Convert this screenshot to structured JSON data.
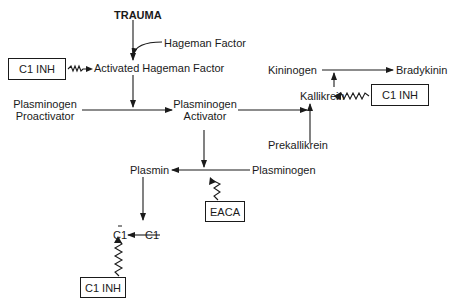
{
  "diagram": {
    "nodes": {
      "trauma": "TRAUMA",
      "hageman_factor": "Hageman Factor",
      "activated_hageman_factor": "Activated Hageman Factor",
      "plasminogen_proactivator_line1": "Plasminogen",
      "plasminogen_proactivator_line2": "Proactivator",
      "plasminogen_activator_line1": "Plasminogen",
      "plasminogen_activator_line2": "Activator",
      "kininogen": "Kininogen",
      "bradykinin": "Bradykinin",
      "kallikrein": "Kallikrein",
      "prekallikrein": "Prekallikrein",
      "plasmin": "Plasmin",
      "plasminogen": "Plasminogen",
      "c1_activated": "C1",
      "c1": "C1"
    },
    "inhibitors": {
      "c1_inh_top": "C1 INH",
      "c1_inh_right": "C1 INH",
      "c1_inh_bottom": "C1 INH",
      "eaca": "EACA"
    },
    "edges": [
      {
        "from": "TRAUMA",
        "to": "Activated Hageman Factor",
        "type": "activation"
      },
      {
        "from": "Hageman Factor",
        "to": "Activated Hageman Factor",
        "type": "activation"
      },
      {
        "from": "Activated Hageman Factor",
        "to": "Plasminogen Activator",
        "type": "activation"
      },
      {
        "from": "Plasminogen Proactivator",
        "to": "Plasminogen Activator",
        "type": "activation"
      },
      {
        "from": "Plasminogen Activator",
        "to": "Kallikrein",
        "type": "activation"
      },
      {
        "from": "Prekallikrein",
        "to": "Kallikrein",
        "type": "activation"
      },
      {
        "from": "Kallikrein",
        "to": "Kininogen→Bradykinin",
        "type": "activation"
      },
      {
        "from": "Kininogen",
        "to": "Bradykinin",
        "type": "activation"
      },
      {
        "from": "Plasminogen Activator",
        "to": "Plasminogen→Plasmin",
        "type": "activation"
      },
      {
        "from": "Plasminogen",
        "to": "Plasmin",
        "type": "activation"
      },
      {
        "from": "Plasmin",
        "to": "C1 (activated)",
        "type": "activation"
      },
      {
        "from": "C1",
        "to": "C1 (activated)",
        "type": "activation"
      },
      {
        "from": "C1 INH",
        "to": "Activated Hageman Factor",
        "type": "inhibition"
      },
      {
        "from": "C1 INH",
        "to": "Kallikrein",
        "type": "inhibition"
      },
      {
        "from": "EACA",
        "to": "Plasminogen→Plasmin",
        "type": "inhibition"
      },
      {
        "from": "C1 INH",
        "to": "C1 (activated)",
        "type": "inhibition"
      }
    ]
  }
}
